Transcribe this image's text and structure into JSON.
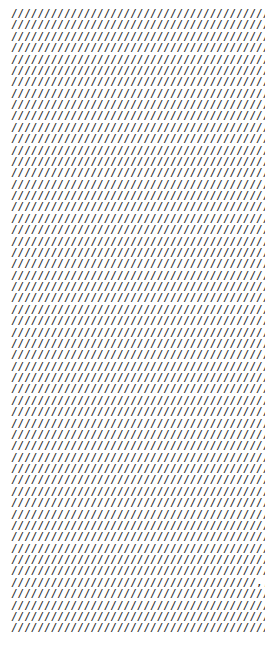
{
  "document": {
    "kind": "plain-text-document",
    "background_color": "#ffffff",
    "text_color": "#262626",
    "glyph": "/",
    "anomaly_glyph": ",",
    "line_count": 55,
    "chars_per_line": 48,
    "anomaly": {
      "line_index": 50,
      "start_char_index": 37,
      "length": 4,
      "glyph": ","
    },
    "lines": [
      {
        "text": "////////////////////////////////////////////////"
      },
      {
        "text": "////////////////////////////////////////////////"
      },
      {
        "text": "////////////////////////////////////////////////"
      },
      {
        "text": "////////////////////////////////////////////////"
      },
      {
        "text": "////////////////////////////////////////////////"
      },
      {
        "text": "////////////////////////////////////////////////"
      },
      {
        "text": "////////////////////////////////////////////////"
      },
      {
        "text": "////////////////////////////////////////////////"
      },
      {
        "text": "////////////////////////////////////////////////"
      },
      {
        "text": "////////////////////////////////////////////////"
      },
      {
        "text": "////////////////////////////////////////////////"
      },
      {
        "text": "////////////////////////////////////////////////"
      },
      {
        "text": "////////////////////////////////////////////////"
      },
      {
        "text": "////////////////////////////////////////////////"
      },
      {
        "text": "////////////////////////////////////////////////"
      },
      {
        "text": "////////////////////////////////////////////////"
      },
      {
        "text": "////////////////////////////////////////////////"
      },
      {
        "text": "////////////////////////////////////////////////"
      },
      {
        "text": "////////////////////////////////////////////////"
      },
      {
        "text": "////////////////////////////////////////////////"
      },
      {
        "text": "////////////////////////////////////////////////"
      },
      {
        "text": "////////////////////////////////////////////////"
      },
      {
        "text": "////////////////////////////////////////////////"
      },
      {
        "text": "////////////////////////////////////////////////"
      },
      {
        "text": "////////////////////////////////////////////////"
      },
      {
        "text": "////////////////////////////////////////////////"
      },
      {
        "text": "////////////////////////////////////////////////"
      },
      {
        "text": "////////////////////////////////////////////////"
      },
      {
        "text": "////////////////////////////////////////////////"
      },
      {
        "text": "////////////////////////////////////////////////"
      },
      {
        "text": "////////////////////////////////////////////////"
      },
      {
        "text": "////////////////////////////////////////////////"
      },
      {
        "text": "////////////////////////////////////////////////"
      },
      {
        "text": "////////////////////////////////////////////////"
      },
      {
        "text": "////////////////////////////////////////////////"
      },
      {
        "text": "////////////////////////////////////////////////"
      },
      {
        "text": "////////////////////////////////////////////////"
      },
      {
        "text": "////////////////////////////////////////////////"
      },
      {
        "text": "////////////////////////////////////////////////"
      },
      {
        "text": "////////////////////////////////////////////////"
      },
      {
        "text": "////////////////////////////////////////////////"
      },
      {
        "text": "////////////////////////////////////////////////"
      },
      {
        "text": "////////////////////////////////////////////////"
      },
      {
        "text": "////////////////////////////////////////////////"
      },
      {
        "text": "////////////////////////////////////////////////"
      },
      {
        "text": "////////////////////////////////////////////////"
      },
      {
        "text": "////////////////////////////////////////////////"
      },
      {
        "text": "////////////////////////////////////////////////"
      },
      {
        "text": "////////////////////////////////////////////////"
      },
      {
        "text": "////////////////////////////////////////////////"
      },
      {
        "text": "/////////////////////////////////////,,,,///////"
      },
      {
        "text": "////////////////////////////////////////////////"
      },
      {
        "text": "////////////////////////////////////////////////"
      },
      {
        "text": "////////////////////////////////////////////////"
      },
      {
        "text": "////////////////////////////////////////////////"
      }
    ]
  }
}
